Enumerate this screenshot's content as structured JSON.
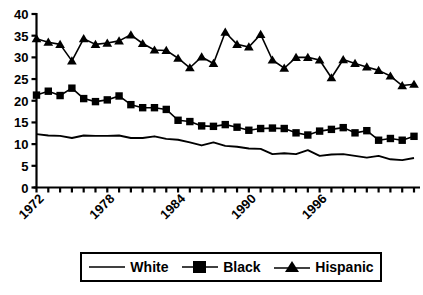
{
  "chart_data": {
    "type": "line",
    "title": "",
    "xlabel": "",
    "ylabel": "",
    "ylim": [
      0,
      40
    ],
    "xlim": [
      1972,
      2004
    ],
    "ytick_labels": [
      "0",
      "5",
      "10",
      "15",
      "20",
      "25",
      "30",
      "35",
      "40"
    ],
    "ytick_values": [
      0,
      5,
      10,
      15,
      20,
      25,
      30,
      35,
      40
    ],
    "xtick_labels": [
      "1972",
      "1978",
      "1984",
      "1990",
      "1996"
    ],
    "xtick_values": [
      1972,
      1978,
      1984,
      1990,
      1996
    ],
    "grid": false,
    "legend_position": "bottom",
    "x": [
      1972,
      1973,
      1974,
      1975,
      1976,
      1977,
      1978,
      1979,
      1980,
      1981,
      1982,
      1983,
      1984,
      1985,
      1986,
      1987,
      1988,
      1989,
      1990,
      1991,
      1992,
      1993,
      1994,
      1995,
      1996,
      1997,
      1998,
      1999,
      2000,
      2001,
      2002,
      2003,
      2004
    ],
    "series": [
      {
        "name": "White",
        "marker": "none",
        "color": "#000000",
        "values": [
          12.3,
          12.0,
          11.9,
          11.4,
          12.0,
          11.9,
          11.9,
          12.0,
          11.4,
          11.4,
          11.8,
          11.2,
          11.0,
          10.4,
          9.7,
          10.4,
          9.6,
          9.4,
          9.0,
          8.9,
          7.7,
          7.9,
          7.7,
          8.6,
          7.3,
          7.6,
          7.7,
          7.3,
          6.9,
          7.3,
          6.5,
          6.3,
          6.8
        ]
      },
      {
        "name": "Black",
        "marker": "square",
        "color": "#000000",
        "values": [
          21.3,
          22.2,
          21.2,
          22.9,
          20.5,
          19.8,
          20.2,
          21.1,
          19.1,
          18.4,
          18.4,
          18.0,
          15.5,
          15.2,
          14.2,
          14.1,
          14.5,
          13.9,
          13.2,
          13.6,
          13.7,
          13.6,
          12.6,
          12.1,
          13.0,
          13.4,
          13.8,
          12.6,
          13.1,
          10.9,
          11.3,
          10.9,
          11.8
        ]
      },
      {
        "name": "Hispanic",
        "marker": "triangle",
        "color": "#000000",
        "values": [
          34.3,
          33.5,
          33.0,
          29.2,
          34.3,
          33.0,
          33.3,
          33.8,
          35.2,
          33.2,
          31.7,
          31.6,
          29.8,
          27.6,
          30.1,
          28.6,
          35.8,
          33.0,
          32.4,
          35.3,
          29.4,
          27.5,
          30.0,
          30.0,
          29.4,
          25.3,
          29.5,
          28.6,
          27.8,
          27.0,
          25.7,
          23.5,
          23.8
        ]
      }
    ]
  },
  "legend": {
    "items": [
      {
        "label": "White",
        "symbol": "line"
      },
      {
        "label": "Black",
        "symbol": "square"
      },
      {
        "label": "Hispanic",
        "symbol": "triangle"
      }
    ]
  }
}
